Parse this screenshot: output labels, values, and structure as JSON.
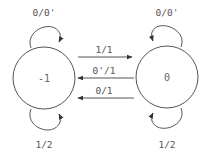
{
  "diagram": {
    "type": "state-machine",
    "states": [
      {
        "id": "s_minus1",
        "label": "-1"
      },
      {
        "id": "s_zero",
        "label": "0"
      }
    ],
    "transitions": [
      {
        "from": "-1",
        "to": "-1",
        "label": "0/0'",
        "position": "top"
      },
      {
        "from": "-1",
        "to": "-1",
        "label": "1/2",
        "position": "bottom"
      },
      {
        "from": "0",
        "to": "0",
        "label": "0/0'",
        "position": "top"
      },
      {
        "from": "0",
        "to": "0",
        "label": "1/2",
        "position": "bottom"
      },
      {
        "from": "-1",
        "to": "0",
        "label": "1/1"
      },
      {
        "from": "0",
        "to": "-1",
        "label": "0'/1"
      },
      {
        "from": "0",
        "to": "-1",
        "label": "0/1"
      }
    ]
  }
}
